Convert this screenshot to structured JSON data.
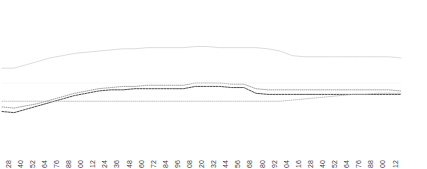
{
  "chart_data": {
    "type": "line",
    "title": "",
    "subtitle": "",
    "xlabel": "",
    "ylabel": "",
    "grid": false,
    "legend": "none",
    "xlim": [
      0,
      33
    ],
    "ylim": [
      0,
      100
    ],
    "categories": [
      "16",
      "28",
      "40",
      "52",
      "64",
      "76",
      "88",
      "00",
      "12",
      "24",
      "36",
      "48",
      "60",
      "72",
      "84",
      "96",
      "08",
      "20",
      "32",
      "44",
      "56",
      "68",
      "80",
      "92",
      "04",
      "16",
      "28",
      "40",
      "52",
      "64",
      "76",
      "88",
      "00",
      "12"
    ],
    "series": [
      {
        "name": "upper-band",
        "style": "solid",
        "color": "#d8d8d8",
        "width": 0.9,
        "values": [
          63,
          63,
          66,
          69,
          72,
          74,
          76,
          77,
          78,
          79,
          80,
          80,
          81,
          81,
          81,
          81,
          82,
          82,
          81,
          81,
          81,
          81,
          80,
          78,
          74,
          73,
          73,
          73,
          73,
          73,
          73,
          73,
          73,
          72
        ]
      },
      {
        "name": "cluster-upper",
        "style": "dotted",
        "color": "#8e8e8e",
        "width": 0.8,
        "values": [
          29,
          28,
          30,
          32,
          35,
          38,
          41,
          43,
          45,
          46,
          47,
          47,
          48,
          48,
          48,
          48,
          50,
          50,
          50,
          49,
          49,
          45,
          44,
          44,
          44,
          44,
          44,
          44,
          44,
          44,
          44,
          44,
          44,
          43
        ]
      },
      {
        "name": "cluster-middle",
        "style": "dash-dot",
        "color": "#3b3b3b",
        "width": 0.9,
        "values": [
          25,
          24,
          27,
          30,
          33,
          36,
          39,
          41,
          43,
          44,
          44,
          45,
          45,
          45,
          45,
          45,
          47,
          47,
          47,
          46,
          46,
          41,
          40,
          40,
          40,
          40,
          40,
          40,
          40,
          40,
          40,
          40,
          40,
          40
        ]
      },
      {
        "name": "cluster-lower",
        "style": "dotted",
        "color": "#b4b4b4",
        "width": 0.8,
        "values": [
          34,
          34,
          34,
          34,
          34,
          34,
          34,
          34,
          34,
          34,
          34,
          34,
          34,
          34,
          34,
          34,
          34,
          34,
          34,
          34,
          34,
          34,
          34,
          34,
          35,
          36,
          37,
          38,
          39,
          40,
          40,
          41,
          41,
          41
        ]
      },
      {
        "name": "baseline-faint",
        "style": "solid",
        "color": "#f4f4f4",
        "width": 0.7,
        "values": [
          50,
          50,
          50,
          50,
          50,
          50,
          50,
          50,
          50,
          50,
          50,
          50,
          50,
          50,
          50,
          50,
          50,
          50,
          50,
          50,
          50,
          50,
          50,
          50,
          50,
          50,
          50,
          50,
          50,
          50,
          50,
          50,
          50,
          50
        ]
      }
    ]
  }
}
